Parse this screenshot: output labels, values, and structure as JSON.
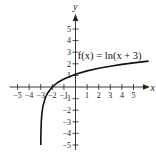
{
  "chart_data": {
    "type": "line",
    "title": "",
    "xlabel": "x",
    "ylabel": "y",
    "xlim": [
      -5.5,
      6.3
    ],
    "ylim": [
      -5.5,
      6.3
    ],
    "grid": false,
    "legend": null,
    "x_ticks": [
      -5,
      -4,
      -3,
      -2,
      -1,
      1,
      2,
      3,
      4,
      5
    ],
    "y_ticks": [
      -5,
      -4,
      -3,
      -2,
      -1,
      1,
      2,
      3,
      4,
      5
    ],
    "x_tick_labels": [
      "−5",
      "−4",
      "−3",
      "−2",
      "−1",
      "1",
      "2",
      "3",
      "4",
      "5"
    ],
    "y_tick_labels": [
      "−5",
      "−4",
      "−3",
      "−2",
      "−1",
      "1",
      "2",
      "3",
      "4",
      "5"
    ],
    "series": [
      {
        "name": "f(x) = ln(x + 3)",
        "function": "ln(x + 3)",
        "x": [
          -2.9933,
          -2.98,
          -2.95,
          -2.9,
          -2.8,
          -2.6,
          -2.4,
          -2.0,
          -1.5,
          -1.0,
          0,
          1,
          2,
          3,
          4,
          5,
          6.3
        ],
        "y": [
          -5.0,
          -3.91,
          -3.0,
          -2.3,
          -1.61,
          -0.92,
          -0.51,
          0.0,
          0.41,
          0.69,
          1.1,
          1.39,
          1.61,
          1.79,
          1.95,
          2.08,
          2.23
        ]
      }
    ],
    "annotations": [
      {
        "text": "f(x) = ln(x + 3)",
        "x": 0.2,
        "y": 2.7
      }
    ],
    "colors": {
      "curve": "#111111",
      "axes": "#222222"
    }
  },
  "labels": {
    "x_axis": "x",
    "y_axis": "y",
    "function": "f(x) = ln(x + 3)"
  }
}
